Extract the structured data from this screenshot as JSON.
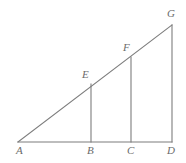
{
  "figure": {
    "type": "geometry-diagram",
    "background_color": "#ffffff",
    "stroke_color": "#7d7d7d",
    "label_color": "#6b6b6b",
    "stroke_width": 1.1,
    "points": {
      "A": {
        "label": "A",
        "x": 18,
        "y": 142,
        "label_x": 16,
        "label_y": 145
      },
      "B": {
        "label": "B",
        "x": 91,
        "y": 142,
        "label_x": 87,
        "label_y": 145
      },
      "C": {
        "label": "C",
        "x": 131,
        "y": 142,
        "label_x": 127,
        "label_y": 145
      },
      "D": {
        "label": "D",
        "x": 172,
        "y": 142,
        "label_x": 167,
        "label_y": 145
      },
      "E": {
        "label": "E",
        "x": 91,
        "y": 84,
        "label_x": 82,
        "label_y": 69
      },
      "F": {
        "label": "F",
        "x": 131,
        "y": 57,
        "label_x": 123,
        "label_y": 42
      },
      "G": {
        "label": "G",
        "x": 172,
        "y": 25,
        "label_x": 167,
        "label_y": 8
      }
    },
    "segments": [
      {
        "name": "base-AD",
        "from": "A",
        "to": "D"
      },
      {
        "name": "hypotenuse-AG",
        "from": "A",
        "to": "G"
      },
      {
        "name": "altitude-GD",
        "from": "G",
        "to": "D"
      },
      {
        "name": "segment-EB",
        "from": "E",
        "to": "B"
      },
      {
        "name": "segment-FC",
        "from": "F",
        "to": "C"
      }
    ]
  }
}
